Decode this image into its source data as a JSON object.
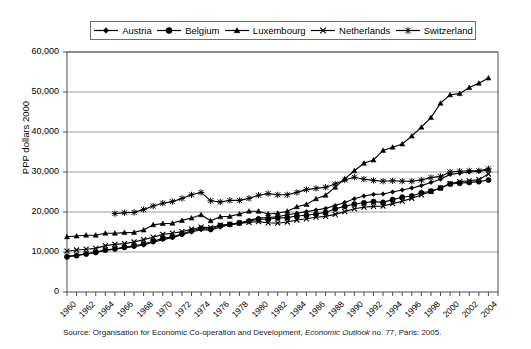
{
  "chart_data": {
    "type": "line",
    "title": "",
    "xlabel": "",
    "ylabel": "PPP dollars 2000",
    "xlim": [
      1960,
      2005
    ],
    "ylim": [
      0,
      60000
    ],
    "ytick_step": 10000,
    "grid": true,
    "legend_position": "top-center",
    "x": [
      1960,
      1961,
      1962,
      1963,
      1964,
      1965,
      1966,
      1967,
      1968,
      1969,
      1970,
      1971,
      1972,
      1973,
      1974,
      1975,
      1976,
      1977,
      1978,
      1979,
      1980,
      1981,
      1982,
      1983,
      1984,
      1985,
      1986,
      1987,
      1988,
      1989,
      1990,
      1991,
      1992,
      1993,
      1994,
      1995,
      1996,
      1997,
      1998,
      1999,
      2000,
      2001,
      2002,
      2003,
      2004
    ],
    "xtick_labels": [
      "1960",
      "1962",
      "1964",
      "1966",
      "1968",
      "1970",
      "1972",
      "1974",
      "1976",
      "1978",
      "1980",
      "1982",
      "1984",
      "1986",
      "1988",
      "1990",
      "1992",
      "1994",
      "1996",
      "1998",
      "2000",
      "2002",
      "2004"
    ],
    "ytick_labels": [
      "0",
      "10,000",
      "20,000",
      "30,000",
      "40,000",
      "50,000",
      "60,000"
    ],
    "ytick_values": [
      0,
      10000,
      20000,
      30000,
      40000,
      50000,
      60000
    ],
    "series": [
      {
        "name": "Austria",
        "marker": "diamond",
        "values": [
          8900,
          9200,
          9550,
          9900,
          10400,
          10700,
          11100,
          11300,
          11750,
          12450,
          13100,
          13600,
          14300,
          15000,
          15550,
          15500,
          16200,
          16900,
          17100,
          17900,
          18500,
          18600,
          18800,
          19300,
          19700,
          20100,
          20500,
          20900,
          21600,
          22400,
          23300,
          24000,
          24400,
          24500,
          25000,
          25500,
          26000,
          26600,
          27400,
          28200,
          29400,
          29700,
          30000,
          30200,
          30500
        ]
      },
      {
        "name": "Belgium",
        "marker": "circle",
        "values": [
          8800,
          9100,
          9500,
          9900,
          10500,
          10800,
          11200,
          11550,
          12000,
          12700,
          13400,
          13800,
          14500,
          15300,
          15900,
          15700,
          16600,
          16900,
          17300,
          17700,
          18200,
          18200,
          18500,
          18600,
          19000,
          19200,
          19500,
          19900,
          20800,
          21400,
          22000,
          22300,
          22600,
          22400,
          23100,
          23700,
          24000,
          24800,
          25200,
          26000,
          27000,
          27200,
          27400,
          27600,
          28000
        ]
      },
      {
        "name": "Luxembourg",
        "marker": "triangle",
        "values": [
          13800,
          14000,
          14200,
          14200,
          14700,
          14700,
          14850,
          14900,
          15500,
          16800,
          17100,
          17200,
          17900,
          18500,
          19300,
          17800,
          18800,
          18900,
          19500,
          20200,
          20200,
          19500,
          19700,
          20200,
          21300,
          21900,
          23300,
          24200,
          26200,
          28300,
          30300,
          32200,
          33000,
          35400,
          36200,
          37000,
          39000,
          41200,
          43600,
          47200,
          49300,
          49600,
          51100,
          52200,
          53500
        ]
      },
      {
        "name": "Netherlands",
        "marker": "x",
        "values": [
          10200,
          10500,
          10700,
          10900,
          11600,
          11900,
          12100,
          12500,
          13100,
          13700,
          14400,
          14700,
          15100,
          15700,
          16200,
          16100,
          16700,
          16900,
          17200,
          17400,
          17600,
          17300,
          17200,
          17500,
          18000,
          18300,
          18700,
          18900,
          19400,
          20100,
          20800,
          21200,
          21400,
          21500,
          22100,
          22700,
          23400,
          24300,
          25100,
          26000,
          27100,
          27600,
          27800,
          28100,
          29500
        ]
      },
      {
        "name": "Switzerland",
        "marker": "asterisk",
        "values": [
          null,
          null,
          null,
          null,
          null,
          19600,
          19800,
          19900,
          20600,
          21500,
          22200,
          22600,
          23400,
          24300,
          24900,
          22800,
          22500,
          22900,
          22900,
          23400,
          24200,
          24600,
          24300,
          24300,
          24900,
          25600,
          25900,
          26200,
          27000,
          28000,
          28700,
          28200,
          27900,
          27700,
          27800,
          27700,
          27700,
          28000,
          28600,
          28900,
          30000,
          30200,
          30300,
          30300,
          30800
        ]
      }
    ]
  },
  "legend": {
    "items": [
      {
        "label": "Austria",
        "marker": "diamond"
      },
      {
        "label": "Belgium",
        "marker": "circle"
      },
      {
        "label": "Luxembourg",
        "marker": "triangle"
      },
      {
        "label": "Netherlands",
        "marker": "x"
      },
      {
        "label": "Switzerland",
        "marker": "asterisk"
      }
    ]
  },
  "axis": {
    "y_title": "PPP dollars 2000"
  },
  "source": {
    "prefix": "Source: Organisation for Economic Co-operation and Development, ",
    "italic": "Economic Outlook",
    "suffix": " no. 77, Paris: 2005."
  },
  "colors": {
    "line": "#000000",
    "grid": "#808080",
    "axis": "#4d4d4d",
    "background": "#ffffff"
  }
}
